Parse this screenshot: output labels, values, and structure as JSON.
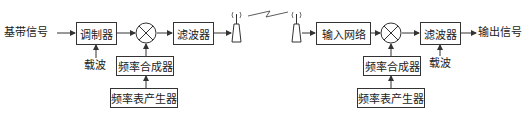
{
  "diagram": {
    "type": "block-diagram",
    "title": "",
    "transmitter": {
      "input_label": "基带信号",
      "modulator": "调制器",
      "carrier_label": "载波",
      "mixer": "mixer",
      "synthesizer": "频率合成器",
      "freq_table_generator": "频率表产生器",
      "filter": "滤波器"
    },
    "channel": {
      "link": "wireless-link"
    },
    "receiver": {
      "input_network": "输入网络",
      "mixer": "mixer",
      "synthesizer": "频率合成器",
      "freq_table_generator": "频率表产生器",
      "filter": "滤波器",
      "carrier_label": "载波",
      "output_label": "输出信号"
    },
    "colors": {
      "line": "#333333",
      "background": "#ffffff"
    }
  }
}
